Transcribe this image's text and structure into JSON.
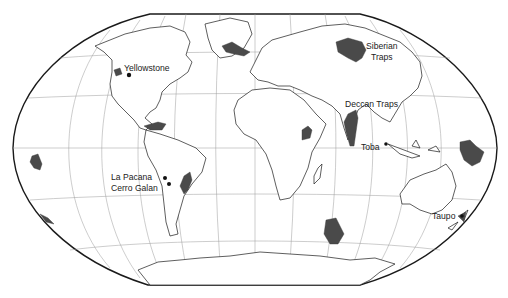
{
  "map": {
    "projection": "winkel-tripel-like world map",
    "colors": {
      "background": "#ffffff",
      "outline": "#1a1a1a",
      "coastline": "#1a1a1a",
      "graticule": "#9a9a9a",
      "volcanic_province_fill": "#4a4a4a",
      "site_marker": "#111111"
    },
    "labels": {
      "yellowstone": "Yellowstone",
      "siberian_traps_line1": "Siberian",
      "siberian_traps_line2": "Traps",
      "deccan_traps": "Deccan Traps",
      "toba": "Toba",
      "la_pacana": "La Pacana",
      "cerro_galan": "Cerro Galan",
      "taupo": "Taupo"
    },
    "sites": [
      {
        "name": "Yellowstone",
        "type": "point",
        "x": 129,
        "y": 75
      },
      {
        "name": "La Pacana",
        "type": "point",
        "x": 165,
        "y": 178
      },
      {
        "name": "Cerro Galan",
        "type": "point",
        "x": 169,
        "y": 184
      },
      {
        "name": "Toba",
        "type": "point",
        "x": 386,
        "y": 144
      },
      {
        "name": "Taupo",
        "type": "point",
        "x": 462,
        "y": 216
      }
    ],
    "provinces": [
      "Siberian Traps",
      "Deccan Traps",
      "Ethiopian Traps",
      "Parana Traps",
      "Caribbean Plateau",
      "North Atlantic Province",
      "Columbia River Basalts",
      "Ontong Java Plateau",
      "Kerguelen Plateau",
      "Pacific plateau"
    ]
  }
}
